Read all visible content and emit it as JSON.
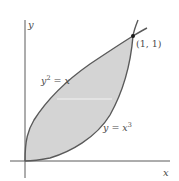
{
  "figure": {
    "axes": {
      "x_label": "x",
      "y_label": "y"
    },
    "curves": [
      {
        "name": "upper-curve",
        "equation_base": "y",
        "equation_sup": "2",
        "equation_rest": " = x"
      },
      {
        "name": "lower-curve",
        "equation_base": "y = x",
        "equation_sup": "3"
      }
    ],
    "intersection_point": {
      "label": "(1, 1)"
    },
    "colors": {
      "region_fill": "#d4d4d4",
      "curve_stroke": "#5a5a5a",
      "axis_stroke": "#5a5a5a",
      "chord": "#f2f2f2",
      "point": "#1a1a1a"
    }
  }
}
